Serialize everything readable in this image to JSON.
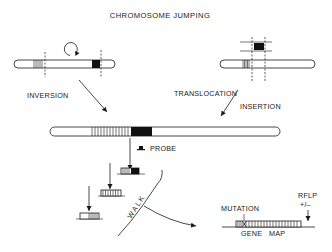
{
  "title": "CHROMOSOME JUMPING",
  "left_panel": {
    "label": "INVERSION",
    "icon": "circular-arrow-icon"
  },
  "right_panel": {
    "label_1": "TRANSLOCATION",
    "label_2": "INSERTION"
  },
  "center": {
    "probe_label": "PROBE",
    "walk_label": "WALK"
  },
  "gene_map": {
    "mutation_label": "MUTATION",
    "rflp_label": "RFLP",
    "rflp_sign": "+/–",
    "map_label_1": "GENE",
    "map_label_2": "MAP"
  },
  "colors": {
    "ink": "#1a1a1a",
    "background": "#ffffff"
  }
}
